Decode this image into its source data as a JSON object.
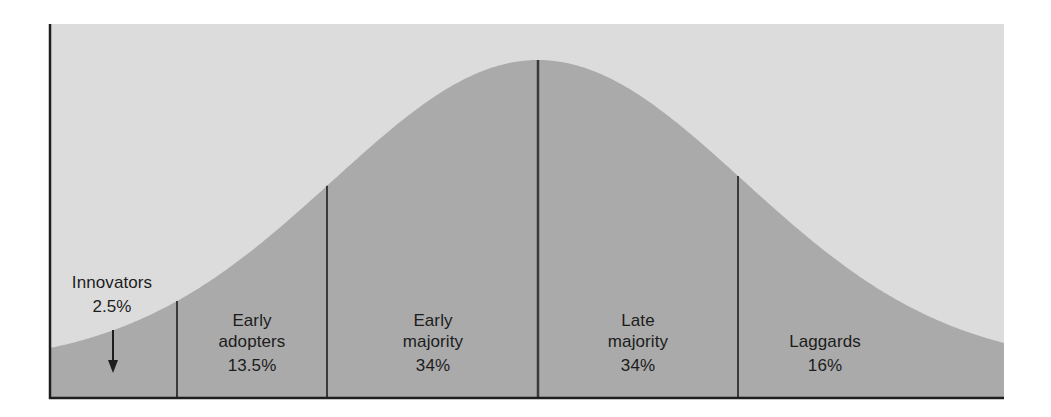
{
  "colors": {
    "background": "#ffffff",
    "panel": "#dcdcdc",
    "curve_fill": "#aaaaaa",
    "lines": "#3a3a3a",
    "text": "#1c1c1c"
  },
  "chart_data": {
    "type": "area",
    "title": "",
    "xlabel": "",
    "ylabel": "",
    "grid": false,
    "legend": "none",
    "segments": [
      {
        "name": "Innovators",
        "line1": "Innovators",
        "line2": "",
        "percent": "2.5%",
        "value": 2.5
      },
      {
        "name": "Early adopters",
        "line1": "Early",
        "line2": "adopters",
        "percent": "13.5%",
        "value": 13.5
      },
      {
        "name": "Early majority",
        "line1": "Early",
        "line2": "majority",
        "percent": "34%",
        "value": 34
      },
      {
        "name": "Late majority",
        "line1": "Late",
        "line2": "majority",
        "percent": "34%",
        "value": 34
      },
      {
        "name": "Laggards",
        "line1": "Laggards",
        "line2": "",
        "percent": "16%",
        "value": 16
      }
    ],
    "annotations": [
      {
        "type": "arrow",
        "target": "Innovators",
        "direction": "down"
      }
    ]
  },
  "labels": {
    "innovators": {
      "name": "Innovators",
      "percent": "2.5%"
    },
    "early_adopters": {
      "line1": "Early",
      "line2": "adopters",
      "percent": "13.5%"
    },
    "early_majority": {
      "line1": "Early",
      "line2": "majority",
      "percent": "34%"
    },
    "late_majority": {
      "line1": "Late",
      "line2": "majority",
      "percent": "34%"
    },
    "laggards": {
      "name": "Laggards",
      "percent": "16%"
    }
  }
}
